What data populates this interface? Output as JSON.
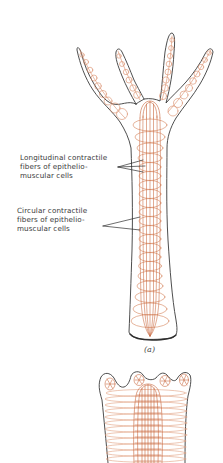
{
  "figure": {
    "labels": {
      "longitudinal": {
        "lines": [
          "Longitudinal contractile",
          "fibers of epithelio-",
          "muscular cells"
        ]
      },
      "circular": {
        "lines": [
          "Circular contractile",
          "fibers of epithelio-",
          "muscular cells"
        ]
      }
    },
    "panels": [
      {
        "id": "a",
        "caption": "(a)",
        "description": "Extended hydra with four tentacles"
      },
      {
        "id": "b",
        "caption": "",
        "description": "Contracted hydra (partially visible)"
      }
    ],
    "colors": {
      "outline": "#3a3a3a",
      "fibers": "#c8643a",
      "fibers_light": "#e0a080",
      "text": "#3a3a3a",
      "background": "#ffffff"
    }
  }
}
